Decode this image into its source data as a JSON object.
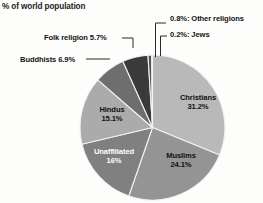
{
  "header": {
    "title": "% of world population"
  },
  "chart_data": {
    "type": "pie",
    "title": "% of world population",
    "xlabel": "",
    "ylabel": "",
    "legend_position": "none",
    "grid": false,
    "unit": "percent of world population",
    "start_angle_deg": 0,
    "direction": "clockwise",
    "categories": [
      "Christians",
      "Muslims",
      "Unaffiliated",
      "Hindus",
      "Buddhists",
      "Folk religion",
      "Other religions",
      "Jews"
    ],
    "values": [
      31.2,
      24.1,
      16,
      15.1,
      6.9,
      5.7,
      0.8,
      0.2
    ],
    "slices": [
      {
        "name": "Christians",
        "label": "Christians",
        "value_label": "31.2%",
        "value": 31.2,
        "color": "#b9b9b9",
        "label_placement": "inside"
      },
      {
        "name": "Muslims",
        "label": "Muslims",
        "value_label": "24.1%",
        "value": 24.1,
        "color": "#949494",
        "label_placement": "inside"
      },
      {
        "name": "Unaffiliated",
        "label": "Unaffiliated",
        "value_label": "16%",
        "value": 16,
        "color": "#808080",
        "label_placement": "inside"
      },
      {
        "name": "Hindus",
        "label": "Hindus",
        "value_label": "15.1%",
        "value": 15.1,
        "color": "#ababab",
        "label_placement": "inside"
      },
      {
        "name": "Buddhists",
        "label": "Buddhists 6.9%",
        "value_label": "6.9%",
        "value": 6.9,
        "color": "#6e6e6e",
        "label_placement": "outside-left"
      },
      {
        "name": "Folk religion",
        "label": "Folk religion 5.7%",
        "value_label": "5.7%",
        "value": 5.7,
        "color": "#3a3a3a",
        "label_placement": "outside-left"
      },
      {
        "name": "Other religions",
        "label": "0.8%: Other religions",
        "value_label": "0.8%",
        "value": 0.8,
        "color": "#545454",
        "label_placement": "outside-top"
      },
      {
        "name": "Jews",
        "label": "0.2%: Jews",
        "value_label": "0.2%",
        "value": 0.2,
        "color": "#2b2b2b",
        "label_placement": "outside-top"
      }
    ]
  },
  "labels": {
    "christians_name": "Christians",
    "christians_value": "31.2%",
    "muslims_name": "Muslims",
    "muslims_value": "24.1%",
    "unaffiliated_name": "Unaffiliated",
    "unaffiliated_value": "16%",
    "hindus_name": "Hindus",
    "hindus_value": "15.1%",
    "buddhists": "Buddhists 6.9%",
    "folk_religion": "Folk religion 5.7%",
    "other_religions": "0.8%: Other religions",
    "jews": "0.2%: Jews"
  }
}
